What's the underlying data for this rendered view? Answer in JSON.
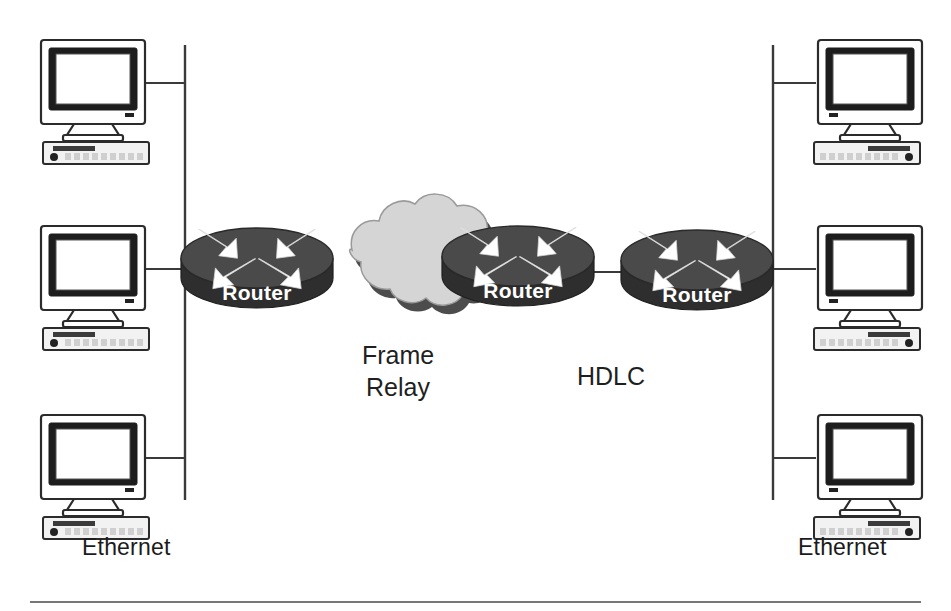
{
  "diagram": {
    "background_color": "#ffffff",
    "labels": {
      "left_network": "Ethernet",
      "right_network": "Ethernet",
      "cloud_line1": "Frame",
      "cloud_line2": "Relay",
      "serial_link": "HDLC"
    },
    "routers": [
      {
        "id": "router-left",
        "label": "Router",
        "x": 257,
        "y": 270
      },
      {
        "id": "router-middle",
        "label": "Router",
        "x": 518,
        "y": 268
      },
      {
        "id": "router-right",
        "label": "Router",
        "x": 697,
        "y": 272
      }
    ],
    "cloud": {
      "id": "frame-relay-cloud",
      "label": "Frame Relay",
      "fill": "#d5d5d5",
      "shadow": "#4c4c4c",
      "x": 393,
      "y": 272
    },
    "hosts": [
      {
        "id": "pc-left-top",
        "side": "left",
        "x": 93,
        "y": 82
      },
      {
        "id": "pc-left-middle",
        "side": "left",
        "x": 93,
        "y": 268
      },
      {
        "id": "pc-left-bottom",
        "side": "left",
        "x": 93,
        "y": 458
      },
      {
        "id": "pc-right-top",
        "side": "right",
        "x": 858,
        "y": 82
      },
      {
        "id": "pc-right-middle",
        "side": "right",
        "x": 858,
        "y": 268
      },
      {
        "id": "pc-right-bottom",
        "side": "right",
        "x": 858,
        "y": 458
      }
    ],
    "bus_segments": [
      {
        "id": "bus-left",
        "x": 185,
        "y_top": 45,
        "y_bottom": 500
      },
      {
        "id": "bus-right",
        "x": 773,
        "y_top": 45,
        "y_bottom": 500
      }
    ],
    "colors": {
      "line": "#3a3a3a",
      "router_top": "#4a4a4a",
      "router_side": "#2e2e2e",
      "cloud": "#d5d5d5",
      "text": "#1b1b1b"
    }
  }
}
